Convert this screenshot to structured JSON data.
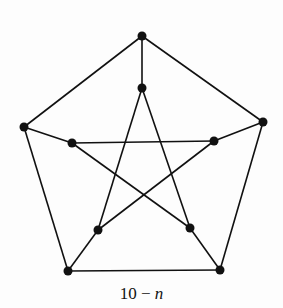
{
  "diagram": {
    "caption_num": "10 − ",
    "caption_var": "n",
    "colors": {
      "line": "#111111",
      "node": "#111111",
      "background": "#fdfdfd"
    },
    "nodes": [
      {
        "id": "o1",
        "x": 142,
        "y": 36
      },
      {
        "id": "o2",
        "x": 263,
        "y": 122
      },
      {
        "id": "o3",
        "x": 220,
        "y": 270
      },
      {
        "id": "o4",
        "x": 68,
        "y": 271
      },
      {
        "id": "o5",
        "x": 24,
        "y": 127
      },
      {
        "id": "i1",
        "x": 142,
        "y": 88
      },
      {
        "id": "i2",
        "x": 214,
        "y": 141
      },
      {
        "id": "i3",
        "x": 190,
        "y": 228
      },
      {
        "id": "i4",
        "x": 98,
        "y": 230
      },
      {
        "id": "i5",
        "x": 72,
        "y": 143
      }
    ],
    "edges": [
      [
        "o1",
        "o2"
      ],
      [
        "o2",
        "o3"
      ],
      [
        "o3",
        "o4"
      ],
      [
        "o4",
        "o5"
      ],
      [
        "o5",
        "o1"
      ],
      [
        "o1",
        "i1"
      ],
      [
        "o2",
        "i2"
      ],
      [
        "o3",
        "i3"
      ],
      [
        "o4",
        "i4"
      ],
      [
        "o5",
        "i5"
      ],
      [
        "i1",
        "i3"
      ],
      [
        "i3",
        "i5"
      ],
      [
        "i5",
        "i2"
      ],
      [
        "i2",
        "i4"
      ],
      [
        "i4",
        "i1"
      ]
    ]
  }
}
